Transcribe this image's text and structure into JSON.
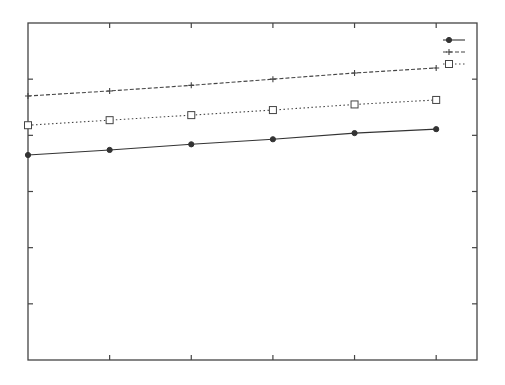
{
  "chart_data": {
    "type": "line",
    "title": "",
    "xlabel": "",
    "ylabel": "",
    "x": [
      0,
      1,
      2,
      3,
      4,
      5
    ],
    "xlim": [
      0,
      5.5
    ],
    "ylim": [
      0,
      6
    ],
    "xticks": [
      1,
      2,
      3,
      4,
      5
    ],
    "yticks": [
      1,
      2,
      3,
      4,
      5
    ],
    "tick_labels_visible": false,
    "grid": false,
    "legend_position": "upper right",
    "series": [
      {
        "name": "",
        "style": "solid",
        "marker": "diamond",
        "color": "#333333",
        "values": [
          3.65,
          3.74,
          3.84,
          3.93,
          4.04,
          4.11
        ]
      },
      {
        "name": "",
        "style": "dashed",
        "marker": "plus",
        "color": "#444444",
        "values": [
          4.7,
          4.79,
          4.89,
          5.0,
          5.11,
          5.2
        ]
      },
      {
        "name": "",
        "style": "dotted",
        "marker": "square",
        "color": "#444444",
        "values": [
          4.18,
          4.27,
          4.36,
          4.45,
          4.55,
          4.63
        ]
      }
    ]
  },
  "plot_frame": {
    "left": 28,
    "top": 23,
    "right": 477,
    "bottom": 360,
    "color": "#444444"
  }
}
